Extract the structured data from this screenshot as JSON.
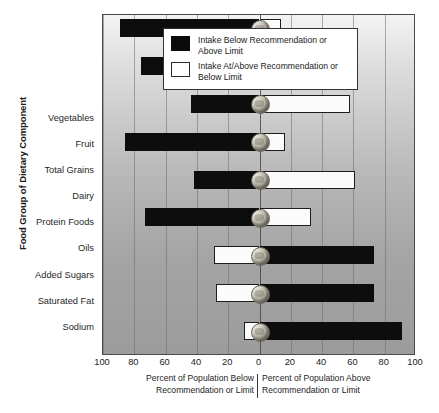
{
  "chart_data": {
    "type": "bar",
    "orientation": "horizontal",
    "layout": "diverging",
    "title": "",
    "ylabel": "Food Group of Dietary Component",
    "xlabel_left": "Percent of Population Below Recommendation or Limit",
    "xlabel_right": "Percent of Population Above Recommendation or Limit",
    "categories": [
      "Vegetables",
      "Fruit",
      "Total Grains",
      "Dairy",
      "Protein Foods",
      "Oils",
      "Added Sugars",
      "Saturated Fat",
      "Sodium"
    ],
    "series": [
      {
        "name": "Percent of Population Below Recommendation or Limit",
        "side": "left",
        "values": [
          89,
          76,
          44,
          86,
          42,
          73,
          29,
          28,
          10
        ]
      },
      {
        "name": "Percent of Population Above Recommendation or Limit",
        "side": "right",
        "values": [
          14,
          28,
          58,
          16,
          61,
          33,
          73,
          73,
          91
        ]
      }
    ],
    "bar_fill_by_row": [
      {
        "category": "Vegetables",
        "left_fill": "black",
        "right_fill": "white"
      },
      {
        "category": "Fruit",
        "left_fill": "black",
        "right_fill": "white"
      },
      {
        "category": "Total Grains",
        "left_fill": "black",
        "right_fill": "white"
      },
      {
        "category": "Dairy",
        "left_fill": "black",
        "right_fill": "white"
      },
      {
        "category": "Protein Foods",
        "left_fill": "black",
        "right_fill": "white"
      },
      {
        "category": "Oils",
        "left_fill": "black",
        "right_fill": "white"
      },
      {
        "category": "Added Sugars",
        "left_fill": "white",
        "right_fill": "black"
      },
      {
        "category": "Saturated Fat",
        "left_fill": "white",
        "right_fill": "black"
      },
      {
        "category": "Sodium",
        "left_fill": "white",
        "right_fill": "black"
      }
    ],
    "xticks": [
      100,
      80,
      60,
      40,
      20,
      0,
      20,
      40,
      60,
      80,
      100
    ],
    "xlim": [
      -100,
      100
    ],
    "grid": true,
    "grid_axis": "x",
    "legend_position": "top-center"
  },
  "legend": {
    "items": [
      {
        "swatch": "black",
        "label": "Intake Below Recommendation or Above Limit"
      },
      {
        "swatch": "white",
        "label": "Intake At/Above Recommendation or Below Limit"
      }
    ]
  },
  "axis": {
    "y_title": "Food Group of Dietary Component",
    "caption_left": "Percent of Population Below Recommendation or Limit",
    "caption_right": "Percent of Population Above Recommendation or Limit"
  },
  "colors": {
    "bar_black": "#0d0d0d",
    "bar_white": "#fbfbfb",
    "plot_background_top": "#f3f3f3",
    "plot_background_bottom": "#9c9c9c",
    "border": "#4a4a4a"
  }
}
